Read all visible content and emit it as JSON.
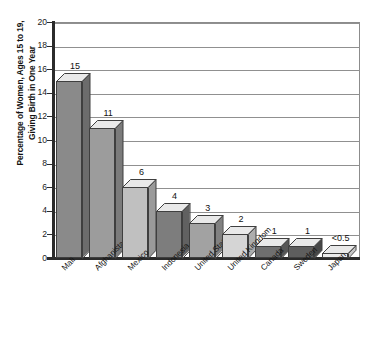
{
  "chart_data": {
    "type": "bar",
    "title": "",
    "subtitle": "",
    "xlabel": "",
    "ylabel": "Percentage of Women, Ages 15 to 19,\nGiving Birth in One Year",
    "ylim": [
      0,
      20
    ],
    "ytick_step": 2,
    "yticks": [
      "20",
      "18",
      "16",
      "14",
      "12",
      "10",
      "8",
      "6",
      "4",
      "2",
      "0"
    ],
    "grid": true,
    "legend": false,
    "categories": [
      "Mali",
      "Afghanistan",
      "Mexico",
      "Indonesia",
      "United States",
      "United Kingdom",
      "Canada",
      "Sweden",
      "Japan"
    ],
    "values": [
      15,
      11,
      6,
      4,
      3,
      2,
      1,
      1,
      0.4
    ],
    "value_labels": [
      "15",
      "11",
      "6",
      "4",
      "3",
      "2",
      "1",
      "1",
      "<0.5"
    ],
    "bar_colors": [
      "#8a8a8a",
      "#9c9c9c",
      "#c0c0c0",
      "#7d7d7d",
      "#a2a2a2",
      "#d5d5d5",
      "#6f6f6f",
      "#5e5e5e",
      "#ebebeb"
    ],
    "bar_side_colors": [
      "#6c6c6c",
      "#7b7b7b",
      "#9a9a9a",
      "#616161",
      "#818181",
      "#adadad",
      "#565656",
      "#474747",
      "#c4c4c4"
    ],
    "bar_top_color": "#e9e9e9",
    "bar_outline_color": "#3f3f3f",
    "axis_color": "#2b2b2b",
    "gridline_color": "#909090",
    "background_color": "#ffffff"
  }
}
